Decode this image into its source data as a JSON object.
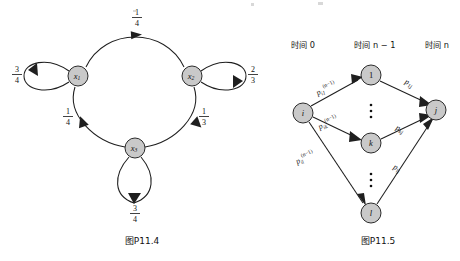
{
  "page": {
    "width": 460,
    "height": 261,
    "background": "#ffffff",
    "node_fill": "#c9c9c9",
    "stroke": "#1f1f1f"
  },
  "figure_left": {
    "caption": "图P11.4",
    "nodes": [
      {
        "id": "x1",
        "label": "x",
        "sub": "1",
        "cx": 78,
        "cy": 76,
        "r": 10
      },
      {
        "id": "x2",
        "label": "x",
        "sub": "2",
        "cx": 192,
        "cy": 76,
        "r": 10
      },
      {
        "id": "x3",
        "label": "x",
        "sub": "3",
        "cx": 135,
        "cy": 148,
        "r": 10
      }
    ],
    "edges": [
      {
        "from": "x1",
        "to": "x2",
        "label_num": "1",
        "label_den": "4",
        "label_x": 137,
        "label_y": 20
      },
      {
        "from": "x1",
        "to": "x3",
        "label_num": "1",
        "label_den": "4",
        "label_x": 77,
        "label_y": 118
      },
      {
        "from": "x2",
        "to": "x3",
        "label_num": "1",
        "label_den": "3",
        "label_x": 192,
        "label_y": 118
      },
      {
        "from": "x1",
        "to": "x1",
        "label_num": "3",
        "label_den": "4",
        "label_x": 17,
        "label_y": 68,
        "type": "self-loop-left"
      },
      {
        "from": "x2",
        "to": "x2",
        "label_num": "2",
        "label_den": "3",
        "label_x": 243,
        "label_y": 68,
        "type": "self-loop-right"
      },
      {
        "from": "x3",
        "to": "x3",
        "label_num": "3",
        "label_den": "4",
        "label_x": 135,
        "label_y": 212,
        "type": "self-loop-bottom"
      }
    ]
  },
  "figure_right": {
    "caption": "图P11.5",
    "time_headers": [
      {
        "text": "时间 0",
        "x": 303,
        "y": 48
      },
      {
        "text": "时间 n − 1",
        "x": 375,
        "y": 48
      },
      {
        "text": "时间 n",
        "x": 437,
        "y": 48
      }
    ],
    "nodes": [
      {
        "id": "i",
        "label": "i",
        "cx": 303,
        "cy": 113,
        "r": 10
      },
      {
        "id": "1",
        "label": "1",
        "cx": 371,
        "cy": 75,
        "r": 10
      },
      {
        "id": "k",
        "label": "k",
        "cx": 371,
        "cy": 143,
        "r": 10
      },
      {
        "id": "l",
        "label": "l",
        "cx": 371,
        "cy": 213,
        "r": 10
      },
      {
        "id": "j",
        "label": "j",
        "cx": 436,
        "cy": 110,
        "r": 10
      }
    ],
    "edges": [
      {
        "from": "i",
        "to": "1",
        "base": "p",
        "sub": "i1",
        "sup": "(n−1)",
        "label_x": 325,
        "label_y": 86
      },
      {
        "from": "i",
        "to": "k",
        "base": "p",
        "sub": "ik",
        "sup": "(n−1)",
        "label_x": 327,
        "label_y": 120
      },
      {
        "from": "i",
        "to": "l",
        "base": "p",
        "sub": "il",
        "sup": "(n−1)",
        "label_x": 306,
        "label_y": 156
      },
      {
        "from": "1",
        "to": "j",
        "base": "p",
        "sub": "1j",
        "sup": "",
        "label_x": 408,
        "label_y": 83
      },
      {
        "from": "k",
        "to": "j",
        "base": "p",
        "sub": "kj",
        "sup": "",
        "label_x": 399,
        "label_y": 128
      },
      {
        "from": "l",
        "to": "j",
        "base": "p",
        "sub": "lj",
        "sup": "",
        "label_x": 396,
        "label_y": 166
      }
    ],
    "ellipsis": [
      {
        "x": 371,
        "y": 110,
        "glyph": "vertical-dots"
      },
      {
        "x": 371,
        "y": 180,
        "glyph": "vertical-dots"
      }
    ]
  }
}
